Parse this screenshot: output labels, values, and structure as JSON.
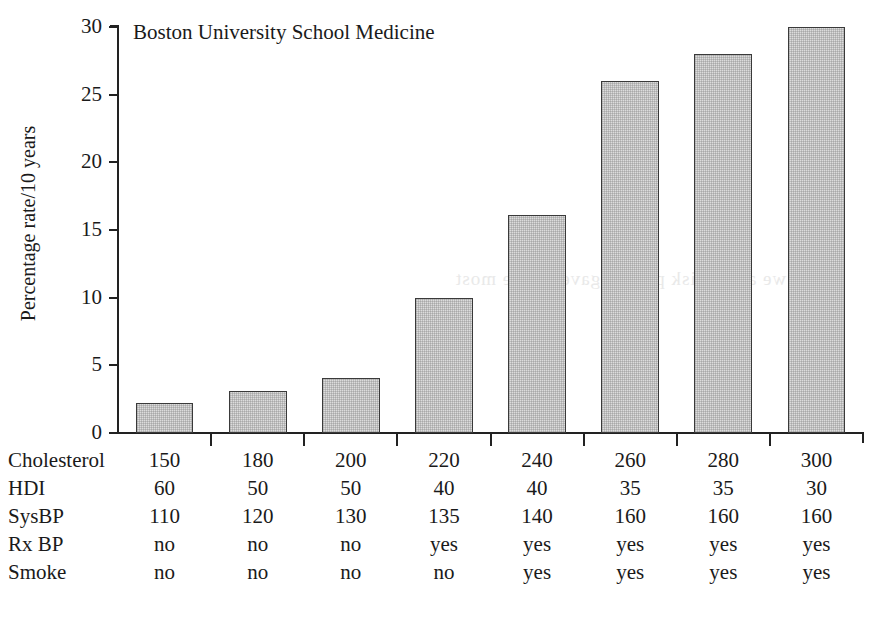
{
  "chart_data": {
    "type": "bar",
    "title": "Boston University School Medicine",
    "xlabel": "",
    "ylabel": "Percentage rate/10 years",
    "ylim": [
      0,
      30
    ],
    "yticks": [
      0,
      5,
      10,
      15,
      20,
      25,
      30
    ],
    "ytick_labels": [
      "0",
      "5",
      "10",
      "15",
      "20",
      "25",
      "30"
    ],
    "grid": false,
    "legend": null,
    "categories": [
      "1",
      "2",
      "3",
      "4",
      "5",
      "6",
      "7",
      "8"
    ],
    "values": [
      2.2,
      3.1,
      4.1,
      10.0,
      16.1,
      26.0,
      28.0,
      30.0
    ],
    "series": [
      {
        "name": "Percentage rate/10 years",
        "values": [
          2.2,
          3.1,
          4.1,
          10.0,
          16.1,
          26.0,
          28.0,
          30.0
        ]
      }
    ],
    "bar_fill": "#dcdcdc",
    "bar_edge": "#3a3a3a",
    "risk_table": {
      "rows": [
        {
          "label": "Cholesterol",
          "values": [
            "150",
            "180",
            "200",
            "220",
            "240",
            "260",
            "280",
            "300"
          ]
        },
        {
          "label": "HDI",
          "values": [
            "60",
            "50",
            "50",
            "40",
            "40",
            "35",
            "35",
            "30"
          ]
        },
        {
          "label": "SysBP",
          "values": [
            "110",
            "120",
            "130",
            "135",
            "140",
            "160",
            "160",
            "160"
          ]
        },
        {
          "label": "Rx BP",
          "values": [
            "no",
            "no",
            "no",
            "yes",
            "yes",
            "yes",
            "yes",
            "yes"
          ]
        },
        {
          "label": "Smoke",
          "values": [
            "no",
            "no",
            "no",
            "no",
            "yes",
            "yes",
            "yes",
            "yes"
          ]
        }
      ]
    }
  },
  "artifact": {
    "showthrough_text": "we are at risk patient gave on the most"
  }
}
